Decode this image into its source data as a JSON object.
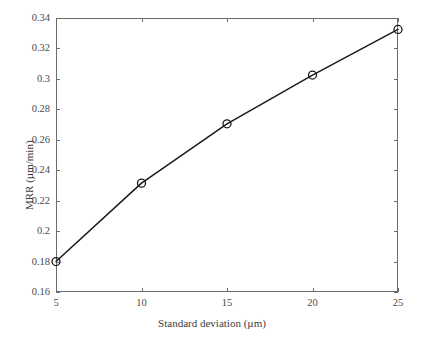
{
  "chart_data": {
    "type": "line",
    "title": "",
    "subtitle": "",
    "xlabel": "Standard deviation (µm)",
    "ylabel": "MRR (µm/min)",
    "x": [
      5,
      10,
      15,
      20,
      25
    ],
    "values": [
      0.18,
      0.2315,
      0.2705,
      0.3025,
      0.3325
    ],
    "series": [
      {
        "name": "MRR",
        "x": [
          5,
          10,
          15,
          20,
          25
        ],
        "values": [
          0.18,
          0.2315,
          0.2705,
          0.3025,
          0.3325
        ]
      }
    ],
    "xlim": [
      5,
      25
    ],
    "ylim": [
      0.16,
      0.34
    ],
    "xticks": [
      5,
      10,
      15,
      20,
      25
    ],
    "yticks": [
      0.16,
      0.18,
      0.2,
      0.22,
      0.24,
      0.26,
      0.28,
      0.3,
      0.32,
      0.34
    ],
    "xtick_labels": [
      "5",
      "10",
      "15",
      "20",
      "25"
    ],
    "ytick_labels": [
      "0.16",
      "0.18",
      "0.2",
      "0.22",
      "0.24",
      "0.26",
      "0.28",
      "0.3",
      "0.32",
      "0.34"
    ],
    "grid": false,
    "legend": false,
    "legend_position": "none",
    "tick_direction": "in",
    "marker": "open-circle",
    "line_color": "#1a1a1a",
    "marker_edge_color": "#1a1a1a",
    "marker_face_color": "#ffffff",
    "axis_color": "#6b6b6b",
    "background_color": "#ffffff",
    "annotations": []
  },
  "plot_geometry": {
    "left": 56,
    "top": 18,
    "right": 398,
    "bottom": 292
  }
}
